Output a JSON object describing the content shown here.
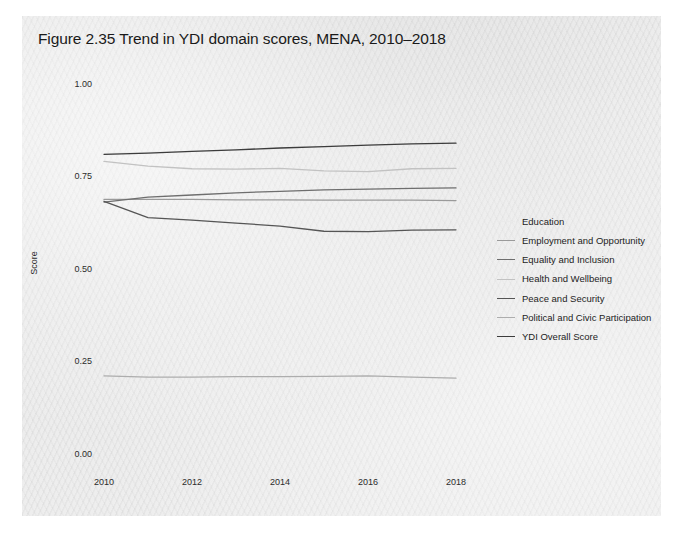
{
  "figure": {
    "title": "Figure 2.35   Trend in YDI domain scores, MENA, 2010–2018"
  },
  "axes": {
    "y_label": "Score",
    "y_ticks": [
      "0.00",
      "0.25",
      "0.50",
      "0.75",
      "1.00"
    ],
    "x_ticks": [
      "2010",
      "2012",
      "2014",
      "2016",
      "2018"
    ]
  },
  "legend": {
    "items": [
      {
        "label": "Education",
        "color": "#eaeaea"
      },
      {
        "label": "Employment and Opportunity",
        "color": "#9a9a9a"
      },
      {
        "label": "Equality and Inclusion",
        "color": "#6e6e6e"
      },
      {
        "label": "Health and Wellbeing",
        "color": "#c2c2c2"
      },
      {
        "label": "Peace and Security",
        "color": "#555555"
      },
      {
        "label": "Political and Civic Participation",
        "color": "#adadad"
      },
      {
        "label": "YDI Overall Score",
        "color": "#3c3c3c"
      }
    ]
  },
  "chart_data": {
    "type": "line",
    "title": "Figure 2.35   Trend in YDI domain scores, MENA, 2010–2018",
    "xlabel": "",
    "ylabel": "Score",
    "x": [
      2010,
      2011,
      2012,
      2013,
      2014,
      2015,
      2016,
      2017,
      2018
    ],
    "xlim": [
      2010,
      2018
    ],
    "ylim": [
      0.0,
      1.0
    ],
    "yticks": [
      0.0,
      0.25,
      0.5,
      0.75,
      1.0
    ],
    "xticks": [
      2010,
      2012,
      2014,
      2016,
      2018
    ],
    "grid": false,
    "legend_position": "right",
    "series": [
      {
        "name": "Education",
        "color": "#eaeaea",
        "values": [
          0.812,
          0.815,
          0.818,
          0.822,
          0.826,
          0.83,
          0.834,
          0.837,
          0.84
        ]
      },
      {
        "name": "Employment and Opportunity",
        "color": "#9a9a9a",
        "values": [
          0.688,
          0.688,
          0.688,
          0.687,
          0.687,
          0.686,
          0.686,
          0.686,
          0.685
        ]
      },
      {
        "name": "Equality and Inclusion",
        "color": "#6e6e6e",
        "values": [
          0.681,
          0.694,
          0.7,
          0.706,
          0.71,
          0.714,
          0.716,
          0.718,
          0.719
        ]
      },
      {
        "name": "Health and Wellbeing",
        "color": "#c2c2c2",
        "values": [
          0.791,
          0.778,
          0.771,
          0.77,
          0.772,
          0.765,
          0.763,
          0.771,
          0.772
        ]
      },
      {
        "name": "Peace and Security",
        "color": "#555555",
        "values": [
          0.683,
          0.639,
          0.632,
          0.624,
          0.616,
          0.602,
          0.601,
          0.605,
          0.606
        ]
      },
      {
        "name": "Political and Civic Participation",
        "color": "#adadad",
        "values": [
          0.211,
          0.208,
          0.208,
          0.209,
          0.209,
          0.21,
          0.211,
          0.208,
          0.205
        ]
      },
      {
        "name": "YDI Overall Score",
        "color": "#3c3c3c",
        "values": [
          0.81,
          0.813,
          0.818,
          0.822,
          0.827,
          0.831,
          0.835,
          0.838,
          0.84
        ]
      }
    ]
  }
}
